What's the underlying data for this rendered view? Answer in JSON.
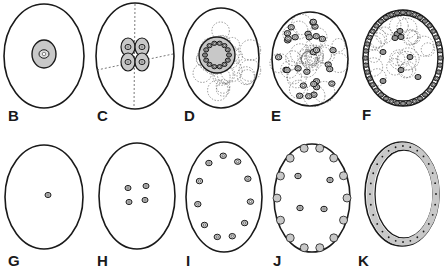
{
  "figure": {
    "rows": [
      {
        "panels": [
          {
            "id": "B",
            "label": "B",
            "lx": 8,
            "ly": 108,
            "cx": 44,
            "cy": 56,
            "rx": 40,
            "ry": 52,
            "type": "single-shaded"
          },
          {
            "id": "C",
            "label": "C",
            "lx": 97,
            "ly": 108,
            "cx": 135,
            "cy": 56,
            "rx": 39,
            "ry": 53,
            "type": "four-shaded"
          },
          {
            "id": "D",
            "label": "D",
            "lx": 185,
            "ly": 108,
            "cx": 221,
            "cy": 58,
            "rx": 38,
            "ry": 50,
            "type": "morula"
          },
          {
            "id": "E",
            "label": "E",
            "lx": 271,
            "ly": 108,
            "cx": 310,
            "cy": 59,
            "rx": 38,
            "ry": 47,
            "type": "scattered"
          },
          {
            "id": "F",
            "label": "F",
            "lx": 362,
            "ly": 106,
            "cx": 403,
            "cy": 58,
            "rx": 40,
            "ry": 48,
            "type": "blastoderm"
          }
        ]
      },
      {
        "panels": [
          {
            "id": "G",
            "label": "G",
            "lx": 8,
            "ly": 253,
            "cx": 44,
            "cy": 197,
            "rx": 39,
            "ry": 52,
            "type": "one-nucleus"
          },
          {
            "id": "H",
            "label": "H",
            "lx": 97,
            "ly": 253,
            "cx": 137,
            "cy": 196,
            "rx": 38,
            "ry": 53,
            "type": "four-nuclei"
          },
          {
            "id": "I",
            "label": "I",
            "lx": 185,
            "ly": 253,
            "cx": 224,
            "cy": 197,
            "rx": 38,
            "ry": 55,
            "type": "nuclei-ring"
          },
          {
            "id": "J",
            "label": "J",
            "lx": 271,
            "ly": 253,
            "cx": 312,
            "cy": 198,
            "rx": 38,
            "ry": 54,
            "type": "periphery"
          },
          {
            "id": "K",
            "label": "K",
            "lx": 357,
            "ly": 253,
            "cx": 402,
            "cy": 194,
            "rx": 37,
            "ry": 52,
            "type": "epithelium"
          }
        ]
      }
    ],
    "colors": {
      "stroke": "#1a1a1a",
      "shade": "#c8c8c8",
      "dash": "#555555"
    }
  }
}
